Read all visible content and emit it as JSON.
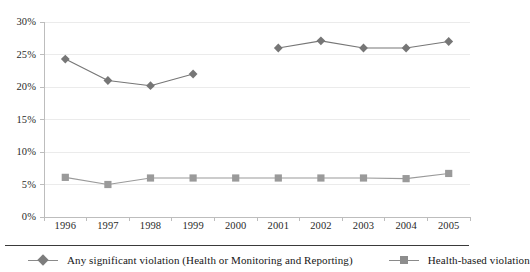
{
  "chart_data": {
    "type": "line",
    "title": "",
    "subtitle": "",
    "xlabel": "",
    "ylabel": "",
    "categories": [
      "1996",
      "1997",
      "1998",
      "1999",
      "2000",
      "2001",
      "2002",
      "2003",
      "2004",
      "2005"
    ],
    "ylim": [
      0,
      30
    ],
    "y_ticks": [
      0,
      5,
      10,
      15,
      20,
      25,
      30
    ],
    "y_tick_labels": [
      "0%",
      "5%",
      "10%",
      "15%",
      "20%",
      "25%",
      "30%"
    ],
    "grid": true,
    "grid_axis": "y",
    "legend_position": "bottom",
    "series": [
      {
        "name": "Any significant violation (Health or Monitoring and Reporting)",
        "marker": "diamond",
        "color": "#767676",
        "values": [
          24.3,
          21.0,
          20.2,
          22.0,
          null,
          26.0,
          27.1,
          26.0,
          26.0,
          27.0
        ]
      },
      {
        "name": "Health-based violation",
        "marker": "square",
        "color": "#9a9a9a",
        "values": [
          6.1,
          5.0,
          6.0,
          6.0,
          6.0,
          6.0,
          6.0,
          6.0,
          5.9,
          6.7
        ]
      }
    ]
  },
  "axes": {
    "y_tick_labels": [
      "30%",
      "25%",
      "20%",
      "15%",
      "10%",
      "5%",
      "0%"
    ],
    "x_tick_labels": [
      "1996",
      "1997",
      "1998",
      "1999",
      "2000",
      "2001",
      "2002",
      "2003",
      "2004",
      "2005"
    ]
  },
  "legend": {
    "items": [
      {
        "label": "Any significant violation (Health or Monitoring and Reporting)",
        "marker": "diamond-marker"
      },
      {
        "label": "Health-based violation",
        "marker": "square-marker"
      }
    ]
  },
  "colors": {
    "series1": "#767676",
    "series2": "#9a9a9a",
    "gridline": "#ebebeb",
    "axis": "#bdbdbd",
    "text": "#1a1a1a"
  }
}
